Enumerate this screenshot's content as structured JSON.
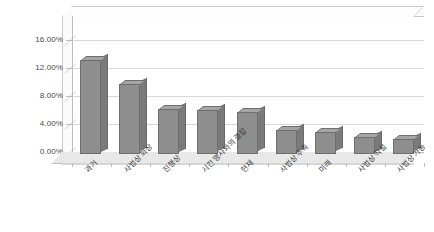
{
  "chart_data": {
    "type": "bar",
    "title": "",
    "subtitle": "",
    "xlabel": "",
    "ylabel": "",
    "categories": [
      "과거",
      "사법상 회상",
      "진행상",
      "시간 명사와의 결합",
      "현재",
      "사법상 추측",
      "미래",
      "사법상 직설",
      "사법상 가능"
    ],
    "values": [
      13.5,
      10.0,
      6.5,
      6.3,
      6.0,
      3.5,
      3.2,
      2.5,
      2.2
    ],
    "value_labels": [
      "13.50%",
      "10.00%",
      "6.50%",
      "6.30%",
      "6.00%",
      "3.50%",
      "3.20%",
      "2.50%",
      "2.20%"
    ],
    "ylim": [
      0,
      16
    ],
    "ytick_values": [
      0,
      4,
      8,
      12,
      16
    ],
    "ytick_labels": [
      "0.00%",
      "4.00%",
      "8.00%",
      "12.00%",
      "16.00%"
    ],
    "grid": true,
    "legend": false,
    "legend_position": "none",
    "three_d": true,
    "series": [
      {
        "name": "",
        "values": [
          13.5,
          10.0,
          6.5,
          6.3,
          6.0,
          3.5,
          3.2,
          2.5,
          2.2
        ]
      }
    ],
    "colors": {
      "bar_face": "#8e8e8e",
      "bar_side": "#7a7a7a",
      "bar_top": "#a5a5a5",
      "bar_outline": "#6e6e6e",
      "grid": "#d8d8d8",
      "axis": "#bdbdbd",
      "floor": "#e8e8e8",
      "plot_background": "#ffffff",
      "text": "#3c3c3c"
    }
  }
}
